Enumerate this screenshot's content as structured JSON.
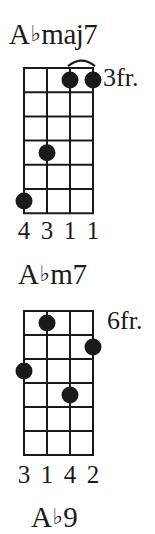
{
  "colors": {
    "ink": "#1a1a1a",
    "background": "#ffffff"
  },
  "chords": [
    {
      "root": "A",
      "accidental": "♭",
      "quality": "maj7",
      "start_fret_label": "3fr.",
      "strings": 4,
      "frets": 6,
      "dots": [
        {
          "string": 1,
          "fret": 6
        },
        {
          "string": 2,
          "fret": 4
        },
        {
          "string": 3,
          "fret": 1
        },
        {
          "string": 4,
          "fret": 1
        }
      ],
      "barre": {
        "from_string": 3,
        "to_string": 4,
        "fret": 1
      },
      "fingering": [
        "4",
        "3",
        "1",
        "1"
      ]
    },
    {
      "root": "A",
      "accidental": "♭",
      "quality": "m7",
      "start_fret_label": "6fr.",
      "strings": 4,
      "frets": 6,
      "dots": [
        {
          "string": 1,
          "fret": 3
        },
        {
          "string": 2,
          "fret": 1
        },
        {
          "string": 3,
          "fret": 4
        },
        {
          "string": 4,
          "fret": 2
        }
      ],
      "fingering": [
        "3",
        "1",
        "4",
        "2"
      ]
    },
    {
      "root": "A",
      "accidental": "♭",
      "quality": "9"
    }
  ]
}
